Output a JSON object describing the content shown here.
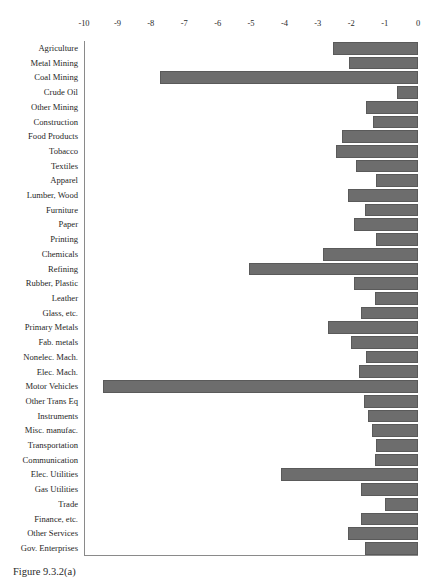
{
  "figure": {
    "caption": "Figure 9.3.2(a)",
    "bar_color": "#6d6d6d",
    "axis_color": "#8a8a8a"
  },
  "chart_data": {
    "type": "bar",
    "orientation": "horizontal",
    "title": "",
    "xlabel": "",
    "ylabel": "",
    "xlim": [
      -10,
      0
    ],
    "grid": false,
    "legend": null,
    "tick_labels": [
      "-10",
      "-9",
      "-8",
      "-7",
      "-6",
      "-5",
      "-4",
      "-3",
      "-2",
      "-1",
      "0"
    ],
    "ticks": [
      -10,
      -9,
      -8,
      -7,
      -6,
      -5,
      -4,
      -3,
      -2,
      -1,
      0
    ],
    "categories": [
      "Agriculture",
      "Metal Mining",
      "Coal Mining",
      "Crude Oil",
      "Other Mining",
      "Construction",
      "Food Products",
      "Tobacco",
      "Textiles",
      "Apparel",
      "Lumber, Wood",
      "Furniture",
      "Paper",
      "Printing",
      "Chemicals",
      "Refining",
      "Rubber, Plastic",
      "Leather",
      "Glass, etc.",
      "Primary Metals",
      "Fab. metals",
      "Nonelec. Mach.",
      "Elec. Mach.",
      "Motor Vehicles",
      "Other Trans Eq",
      "Instruments",
      "Misc. manufac.",
      "Transportation",
      "Communication",
      "Elec. Utilities",
      "Gas Utilities",
      "Trade",
      "Finance, etc.",
      "Other Services",
      "Gov. Enterprises"
    ],
    "values": [
      -2.55,
      -2.07,
      -7.72,
      -0.62,
      -1.55,
      -1.35,
      -2.28,
      -2.45,
      -1.85,
      -1.25,
      -2.1,
      -1.6,
      -1.92,
      -1.25,
      -2.85,
      -5.07,
      -1.92,
      -1.3,
      -1.7,
      -2.7,
      -2.0,
      -1.55,
      -1.78,
      -9.43,
      -1.62,
      -1.5,
      -1.38,
      -1.25,
      -1.3,
      -4.09,
      -1.7,
      -1.0,
      -1.7,
      -2.1,
      -1.6
    ]
  }
}
